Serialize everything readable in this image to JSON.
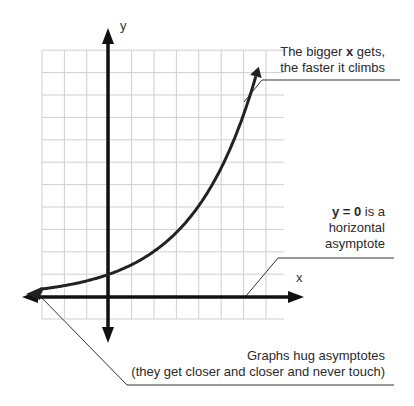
{
  "diagram": {
    "axes": {
      "x_label": "x",
      "y_label": "y"
    },
    "grid": {
      "left": 42,
      "top": 50,
      "right": 284,
      "bottom": 319,
      "cell": 22.4,
      "color": "#cfcfcf"
    },
    "origin_px": {
      "x": 108,
      "y": 297
    },
    "curve": {
      "function": "y = 2^(x/2)",
      "color": "#222222"
    },
    "annotations": {
      "top": {
        "line1_pre": "The bigger ",
        "line1_bold": "x",
        "line1_post": " gets,",
        "line2": "the faster it climbs"
      },
      "middle": {
        "line1_bold": "y = 0",
        "line1_post": " is a",
        "line2": "horizontal",
        "line3": "asymptote"
      },
      "bottom": {
        "line1": "Graphs hug asymptotes",
        "line2": "(they get closer and closer and never touch)"
      }
    }
  },
  "chart_data": {
    "type": "line",
    "title": "",
    "xlabel": "x",
    "ylabel": "y",
    "series": [
      {
        "name": "exponential curve",
        "x": [
          -3,
          -2,
          -1,
          0,
          1,
          2,
          3,
          4,
          5,
          6,
          6.7
        ],
        "values": [
          0.35,
          0.5,
          0.71,
          1,
          1.41,
          2,
          2.83,
          4,
          5.66,
          8,
          10.5
        ]
      }
    ],
    "asymptote": "y = 0",
    "xlim": [
      -3,
      8
    ],
    "ylim": [
      -1,
      11
    ],
    "grid": true
  }
}
